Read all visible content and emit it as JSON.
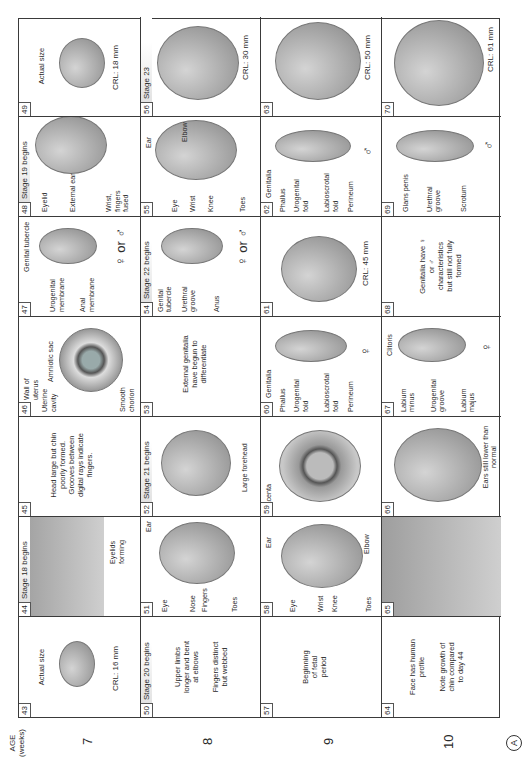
{
  "figure": {
    "orientation": "rotated-90-ccw",
    "panel_letter": "A",
    "age_header": {
      "line1": "AGE",
      "line2": "(weeks)"
    },
    "weeks": [
      "7",
      "8",
      "9",
      "10"
    ]
  },
  "rows": [
    {
      "week": "7",
      "cells": [
        {
          "day": "43",
          "stage": "",
          "texts": [
            "Actual size"
          ],
          "crl": "CRL: 16 mm",
          "labels": []
        },
        {
          "day": "44",
          "stage": "Stage 18 begins",
          "texts": [],
          "crl": "",
          "labels": [
            "Eyelids forming"
          ]
        },
        {
          "day": "45",
          "stage": "",
          "texts": [
            "Head large but chin poorly formed. Grooves between digital rays indicate fingers."
          ],
          "crl": "",
          "labels": []
        },
        {
          "day": "46",
          "stage": "",
          "texts": [],
          "crl": "",
          "labels": [
            "Wall of uterus",
            "Uterine cavity",
            "Amniotic sac",
            "Smooth chorion"
          ]
        },
        {
          "day": "47",
          "stage": "",
          "texts": [],
          "crl": "",
          "labels": [
            "Genital tubercle",
            "Urogenital membrane",
            "Anal membrane"
          ],
          "sex": "♀ or ♂"
        },
        {
          "day": "48",
          "stage": "Stage 19 begins",
          "texts": [],
          "crl": "",
          "labels": [
            "Eyelid",
            "External ear",
            "Wrist, fingers fused"
          ]
        },
        {
          "day": "49",
          "stage": "",
          "texts": [
            "Actual size"
          ],
          "crl": "CRL: 18 mm",
          "labels": []
        }
      ]
    },
    {
      "week": "8",
      "cells": [
        {
          "day": "50",
          "stage": "Stage 20 begins",
          "texts": [
            "Upper limbs longer and bent at elbows",
            "Fingers distinct but webbed"
          ],
          "crl": "",
          "labels": []
        },
        {
          "day": "51",
          "stage": "",
          "texts": [],
          "crl": "",
          "labels": [
            "Eye",
            "Ear",
            "Nose",
            "Fingers",
            "Toes"
          ]
        },
        {
          "day": "52",
          "stage": "Stage 21 begins",
          "texts": [],
          "crl": "",
          "labels": [
            "Large forehead"
          ]
        },
        {
          "day": "53",
          "stage": "",
          "texts": [
            "External genitalia have begun to differentiate"
          ],
          "crl": "",
          "labels": []
        },
        {
          "day": "54",
          "stage": "Stage 22 begins",
          "texts": [],
          "crl": "",
          "labels": [
            "Genital tubercle",
            "Urethral groove",
            "Anus"
          ],
          "sex": "♀ or ♂"
        },
        {
          "day": "55",
          "stage": "",
          "texts": [],
          "crl": "",
          "labels": [
            "Ear",
            "Eye",
            "Wrist",
            "Knee",
            "Elbow",
            "Toes"
          ]
        },
        {
          "day": "56",
          "stage": "Stage 23",
          "texts": [],
          "crl": "CRL: 30 mm",
          "labels": []
        }
      ]
    },
    {
      "week": "9",
      "cells": [
        {
          "day": "57",
          "stage": "",
          "texts": [
            "Beginning of fetal period"
          ],
          "crl": "",
          "labels": []
        },
        {
          "day": "58",
          "stage": "",
          "texts": [],
          "crl": "",
          "labels": [
            "Ear",
            "Eye",
            "Wrist",
            "Knee",
            "Elbow",
            "Toes"
          ]
        },
        {
          "day": "59",
          "stage": "",
          "texts": [],
          "crl": "",
          "labels": [
            "Placenta"
          ]
        },
        {
          "day": "60",
          "stage": "",
          "texts": [
            "Genitalia"
          ],
          "crl": "",
          "labels": [
            "Phallus",
            "Urogenital fold",
            "Labioscrotal fold",
            "Perineum"
          ],
          "sex": "♀"
        },
        {
          "day": "61",
          "stage": "",
          "texts": [],
          "crl": "CRL: 45 mm",
          "labels": []
        },
        {
          "day": "62",
          "stage": "",
          "texts": [
            "Genitalia"
          ],
          "crl": "",
          "labels": [
            "Phallus",
            "Urogenital fold",
            "Labioscrotal fold",
            "Perineum"
          ],
          "sex": "♂"
        },
        {
          "day": "63",
          "stage": "",
          "texts": [],
          "crl": "CRL: 50 mm",
          "labels": []
        }
      ]
    },
    {
      "week": "10",
      "cells": [
        {
          "day": "64",
          "stage": "",
          "texts": [
            "Face has human profile",
            "Note growth of chin compared to day 44"
          ],
          "crl": "",
          "labels": []
        },
        {
          "day": "65",
          "stage": "",
          "texts": [],
          "crl": "",
          "labels": []
        },
        {
          "day": "66",
          "stage": "",
          "texts": [],
          "crl": "",
          "labels": [
            "Ears still lower than normal"
          ]
        },
        {
          "day": "67",
          "stage": "",
          "texts": [],
          "crl": "",
          "labels": [
            "Clitoris",
            "Labium minus",
            "Urogenital groove",
            "Labium majus"
          ],
          "sex": "♀"
        },
        {
          "day": "68",
          "stage": "",
          "texts": [
            "Genitalia have ♀ or ♂ characteristics but still not fully formed"
          ],
          "crl": "",
          "labels": []
        },
        {
          "day": "69",
          "stage": "",
          "texts": [],
          "crl": "",
          "labels": [
            "Glans penis",
            "Urethral groove",
            "Scrotum"
          ],
          "sex": "♂"
        },
        {
          "day": "70",
          "stage": "",
          "texts": [],
          "crl": "CRL: 61 mm",
          "labels": []
        }
      ]
    }
  ]
}
